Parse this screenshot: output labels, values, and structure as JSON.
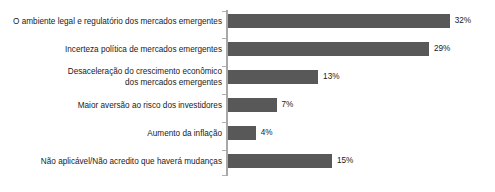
{
  "chart_data": {
    "type": "bar",
    "orientation": "horizontal",
    "title": "",
    "subtitle": "",
    "xlabel": "",
    "ylabel": "",
    "xlim": [
      0,
      35
    ],
    "grid": false,
    "legend": false,
    "value_suffix": "%",
    "bar_color": "#585858",
    "axis_color": "#a8a8a8",
    "text_color": "#1a1a1a",
    "categories": [
      "O ambiente legal e regulatório dos mercados emergentes",
      "Incerteza política de mercados emergentes",
      "Desaceleração do crescimento econômico\ndos mercados emergentes",
      "Maior aversão ao risco dos investidores",
      "Aumento da inflação",
      "Não aplicável/Não acredito que haverá mudanças"
    ],
    "values": [
      32,
      29,
      13,
      7,
      4,
      15
    ],
    "value_labels": [
      "32%",
      "29%",
      "13%",
      "7%",
      "4%",
      "15%"
    ]
  }
}
